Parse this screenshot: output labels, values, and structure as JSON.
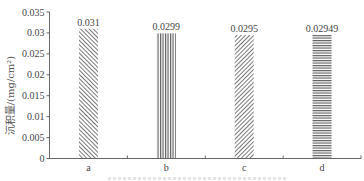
{
  "chart_data": {
    "type": "bar",
    "title": "",
    "xlabel": "",
    "ylabel": "沉积量/(mg/cm²)",
    "categories": [
      "a",
      "b",
      "c",
      "d"
    ],
    "values": [
      0.031,
      0.0299,
      0.0295,
      0.02949
    ],
    "value_labels": [
      "0.031",
      "0.0299",
      "0.0295",
      "0.02949"
    ],
    "bar_patterns": [
      "diagonal-hatch-back",
      "vertical-lines",
      "diagonal-hatch-forward",
      "horizontal-lines"
    ],
    "ylim": [
      0,
      0.035
    ],
    "yticks": [
      0,
      0.005,
      0.01,
      0.015,
      0.02,
      0.025,
      0.03,
      0.035
    ],
    "ytick_labels": [
      "0",
      "0.005",
      "0.01",
      "0.015",
      "0.02",
      "0.025",
      "0.03",
      "0.035"
    ],
    "grid": false,
    "legend": null
  },
  "axis": {
    "ylabel": "沉积量/(mg/cm²)"
  },
  "colors": {
    "bar_stroke": "#555555",
    "axis": "#666666"
  }
}
